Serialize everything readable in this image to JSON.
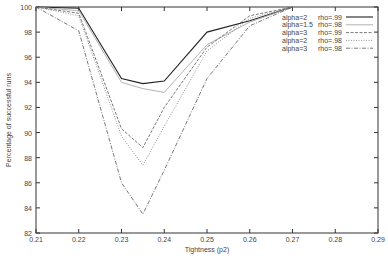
{
  "chart_data": {
    "type": "line",
    "title": "",
    "xlabel": "Tightness (p2)",
    "ylabel": "Percentage of successful runs",
    "xlim": [
      0.21,
      0.29
    ],
    "ylim": [
      82,
      100
    ],
    "x_ticks": [
      "0.21",
      "0.22",
      "0.23",
      "0.24",
      "0.25",
      "0.26",
      "0.27",
      "0.28",
      "0.29"
    ],
    "y_ticks": [
      "82",
      "84",
      "86",
      "88",
      "90",
      "92",
      "94",
      "96",
      "98",
      "100"
    ],
    "grid": false,
    "legend_position": "top-right",
    "x": [
      0.21,
      0.22,
      0.23,
      0.235,
      0.24,
      0.25,
      0.26,
      0.27
    ],
    "series": [
      {
        "name": "alpha=2   rho=.99",
        "style": "solid",
        "color": "#333333",
        "values": [
          100,
          99.9,
          94.3,
          93.9,
          94.1,
          98.0,
          98.9,
          100
        ]
      },
      {
        "name": "alpha=1.5 rho=.98",
        "style": "solid-light",
        "color": "#999999",
        "values": [
          100,
          99.7,
          94.0,
          93.5,
          93.2,
          97.0,
          98.8,
          100
        ]
      },
      {
        "name": "alpha=3   rho=.99",
        "style": "dashed",
        "color": "#555555",
        "values": [
          100,
          99.5,
          90.3,
          88.8,
          92.0,
          96.8,
          99.3,
          100
        ]
      },
      {
        "name": "alpha=2   rho=.98",
        "style": "dotted",
        "color": "#777777",
        "values": [
          100,
          99.3,
          89.7,
          87.4,
          90.5,
          96.5,
          99.1,
          100
        ]
      },
      {
        "name": "alpha=3   rho=.98",
        "style": "dash-dot",
        "color": "#555555",
        "values": [
          100,
          98.1,
          86.0,
          83.5,
          87.0,
          94.3,
          98.5,
          100
        ]
      }
    ]
  },
  "legend": {
    "entries": [
      {
        "alpha": "alpha=2",
        "rho": "rho=.99"
      },
      {
        "alpha": "alpha=1.5",
        "rho": "rho=.98"
      },
      {
        "alpha": "alpha=3",
        "rho": "rho=.99"
      },
      {
        "alpha": "alpha=2",
        "rho": "rho=.98"
      },
      {
        "alpha": "alpha=3",
        "rho": "rho=.98"
      }
    ]
  }
}
